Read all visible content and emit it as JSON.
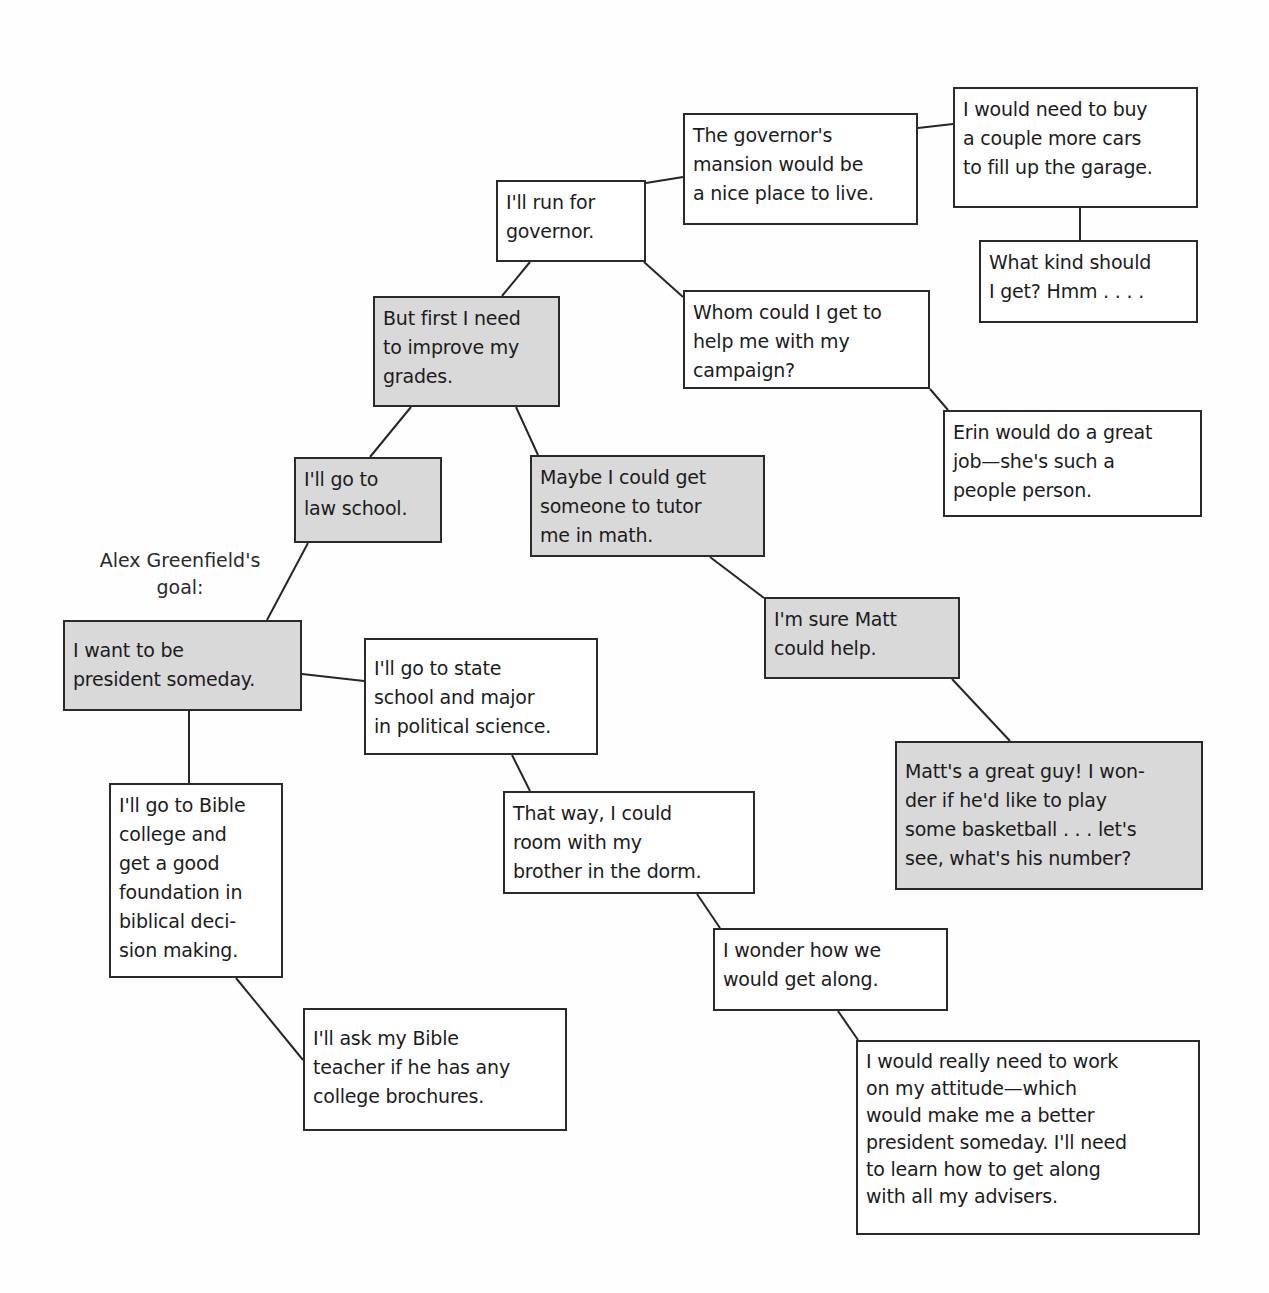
{
  "goal_label": "Alex Greenfield's\ngoal:",
  "colors": {
    "gray_fill": "#d9d9d9",
    "white_fill": "#ffffff",
    "border": "#2a2a2a"
  },
  "nodes": {
    "president": {
      "text": "I want to be\npresident someday.",
      "shaded": true
    },
    "law_school": {
      "text": "I'll go to\nlaw school.",
      "shaded": true
    },
    "first_grades": {
      "text": "But first I need\nto improve my\ngrades.",
      "shaded": true
    },
    "run_governor": {
      "text": "I'll run for\ngovernor.",
      "shaded": false
    },
    "mansion": {
      "text": "The governor's\nmansion would be\na nice place to live.",
      "shaded": false
    },
    "cars": {
      "text": "I would need to buy\na couple more cars\nto fill up the garage.",
      "shaded": false
    },
    "what_kind": {
      "text": "What kind should\nI get? Hmm . . . .",
      "shaded": false
    },
    "campaign": {
      "text": "Whom could I get to\nhelp me with my\ncampaign?",
      "shaded": false
    },
    "erin": {
      "text": "Erin would do a great\njob—she's such a\npeople person.",
      "shaded": false
    },
    "tutor": {
      "text": "Maybe I could get\nsomeone to tutor\nme in math.",
      "shaded": true
    },
    "matt_help": {
      "text": "I'm sure Matt\ncould help.",
      "shaded": true
    },
    "matt_guy": {
      "text": "Matt's a great guy! I won-\nder if he'd like to play\nsome basketball . . . let's\nsee, what's his number?",
      "shaded": true
    },
    "state_school": {
      "text": "I'll go to state\nschool and major\nin political science.",
      "shaded": false
    },
    "room_brother": {
      "text": "That way, I could\nroom with my\nbrother in the dorm.",
      "shaded": false
    },
    "get_along": {
      "text": "I wonder how we\nwould get along.",
      "shaded": false
    },
    "attitude": {
      "text": "I would really need to work\non my attitude—which\nwould make me a better\npresident someday. I'll need\nto learn how to get along\nwith all my advisers.",
      "shaded": false
    },
    "bible_college": {
      "text": "I'll go to Bible\ncollege and\nget a good\nfoundation in\nbiblical deci-\nsion making.",
      "shaded": false
    },
    "bible_teacher": {
      "text": "I'll ask my Bible\nteacher if he has any\ncollege brochures.",
      "shaded": false
    }
  },
  "edges": [
    [
      "president",
      "law_school"
    ],
    [
      "president",
      "state_school"
    ],
    [
      "president",
      "bible_college"
    ],
    [
      "law_school",
      "first_grades"
    ],
    [
      "first_grades",
      "run_governor"
    ],
    [
      "first_grades",
      "tutor"
    ],
    [
      "run_governor",
      "mansion"
    ],
    [
      "run_governor",
      "campaign"
    ],
    [
      "mansion",
      "cars"
    ],
    [
      "cars",
      "what_kind"
    ],
    [
      "campaign",
      "erin"
    ],
    [
      "tutor",
      "matt_help"
    ],
    [
      "matt_help",
      "matt_guy"
    ],
    [
      "state_school",
      "room_brother"
    ],
    [
      "room_brother",
      "get_along"
    ],
    [
      "get_along",
      "attitude"
    ],
    [
      "bible_college",
      "bible_teacher"
    ]
  ]
}
